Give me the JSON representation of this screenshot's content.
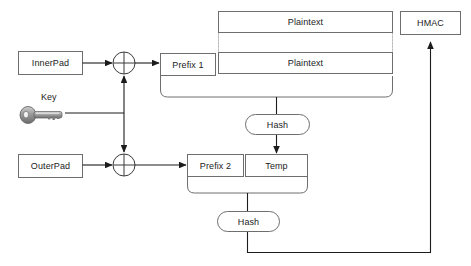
{
  "diagram": {
    "background_color": "#ffffff",
    "stroke_color": "#6e6e6e",
    "arrow_color": "#1c1c1c",
    "text_color": "#1c1c1c",
    "nodes": {
      "inner_pad": "InnerPad",
      "outer_pad": "OuterPad",
      "key": "Key",
      "prefix_1": "Prefix 1",
      "prefix_2": "Prefix 2",
      "plaintext_top": "Plaintext",
      "plaintext_bottom": "Plaintext",
      "temp": "Temp",
      "hash_upper": "Hash",
      "hash_lower": "Hash",
      "hmac": "HMAC"
    },
    "icons": {
      "key_icon": "key-icon",
      "xor_upper": "xor-operator-icon",
      "xor_lower": "xor-operator-icon"
    }
  }
}
